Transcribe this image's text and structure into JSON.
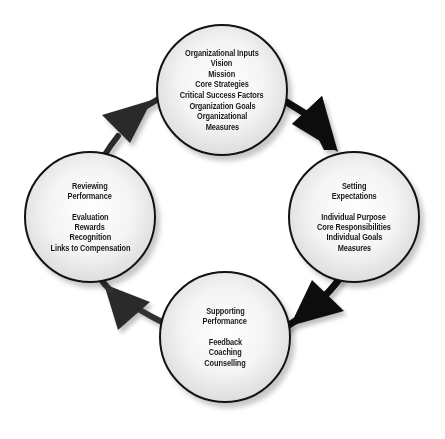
{
  "diagram": {
    "type": "cycle",
    "colors": {
      "node_border": "#111111",
      "arrow": "#111111",
      "background": "#ffffff"
    },
    "nodes": [
      {
        "id": "top",
        "title": [],
        "items": [
          "Organizational Inputs",
          "Vision",
          "Mission",
          "Core Strategies",
          "Critical Success Factors",
          "Organization Goals",
          "Organizational",
          "Measures"
        ]
      },
      {
        "id": "right",
        "title": [
          "Setting",
          "Expectations"
        ],
        "items": [
          "Individual Purpose",
          "Core Responsibilities",
          "Individual Goals",
          "Measures"
        ]
      },
      {
        "id": "bottom",
        "title": [
          "Supporting",
          "Performance"
        ],
        "items": [
          "Feedback",
          "Coaching",
          "Counselling"
        ]
      },
      {
        "id": "left",
        "title": [
          "Reviewing",
          "Performance"
        ],
        "items": [
          "Evaluation",
          "Rewards",
          "Recognition",
          "Links to Compensation"
        ]
      }
    ],
    "edges": [
      {
        "from": "top",
        "to": "right",
        "icon": "arrow-down-right"
      },
      {
        "from": "right",
        "to": "bottom",
        "icon": "arrow-down-left"
      },
      {
        "from": "bottom",
        "to": "left",
        "icon": "arrow-up-left"
      },
      {
        "from": "left",
        "to": "top",
        "icon": "arrow-up-right"
      }
    ]
  }
}
